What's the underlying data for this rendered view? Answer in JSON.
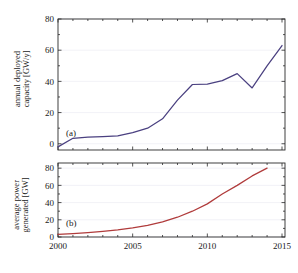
{
  "figure": {
    "background": "#ffffff",
    "axis_color": "#2a2a2a",
    "grid_color": "#e9e9f2"
  },
  "chart_data": [
    {
      "type": "line",
      "panel_tag": "(a)",
      "title": "",
      "xlabel": "",
      "ylabel": "annual deployed capacity [GW/y]",
      "ylabel_line1": "annual deployed",
      "ylabel_line2": "capacity [GW/y]",
      "xlim": [
        2000,
        2015.2
      ],
      "ylim": [
        -4,
        80
      ],
      "xticks": [
        2000,
        2005,
        2010,
        2015
      ],
      "xticklabels": [
        "2000",
        "2005",
        "2010",
        "2015"
      ],
      "xminorticks": [
        2001,
        2002,
        2003,
        2004,
        2006,
        2007,
        2008,
        2009,
        2011,
        2012,
        2013,
        2014
      ],
      "yticks": [
        0,
        20,
        40,
        60,
        80
      ],
      "yticklabels": [
        "0",
        "20",
        "40",
        "60",
        "80"
      ],
      "grid": true,
      "legend": "none",
      "series": [
        {
          "name": "annual deployed capacity",
          "color": "#4a4080",
          "x": [
            2000,
            2001,
            2002,
            2003,
            2004,
            2005,
            2006,
            2007,
            2008,
            2009,
            2010,
            2011,
            2012,
            2013,
            2014,
            2015
          ],
          "values": [
            -2.0,
            3.5,
            4.2,
            4.6,
            5.0,
            7.2,
            10.0,
            16.0,
            28.0,
            38.0,
            38.3,
            40.5,
            45.0,
            35.8,
            50.0,
            63.0
          ]
        }
      ]
    },
    {
      "type": "line",
      "panel_tag": "(b)",
      "title": "",
      "xlabel": "",
      "ylabel": "average power generated [GW]",
      "ylabel_line1": "average power",
      "ylabel_line2": "generated [GW]",
      "xlim": [
        2000,
        2015.2
      ],
      "ylim": [
        0,
        86
      ],
      "xticks": [
        2000,
        2005,
        2010,
        2015
      ],
      "xticklabels": [
        "2000",
        "2005",
        "2010",
        "2015"
      ],
      "xminorticks": [
        2001,
        2002,
        2003,
        2004,
        2006,
        2007,
        2008,
        2009,
        2011,
        2012,
        2013,
        2014
      ],
      "yticks": [
        0,
        20,
        40,
        60,
        80
      ],
      "yticklabels": [
        "0",
        "20",
        "40",
        "60",
        "80"
      ],
      "grid": true,
      "legend": "none",
      "series": [
        {
          "name": "average power generated",
          "color": "#b03b3b",
          "x": [
            2000,
            2001,
            2002,
            2003,
            2004,
            2005,
            2006,
            2007,
            2008,
            2009,
            2010,
            2011,
            2012,
            2013,
            2014
          ],
          "values": [
            3.0,
            4.0,
            5.2,
            6.6,
            8.2,
            10.5,
            13.5,
            17.5,
            23.0,
            30.0,
            38.5,
            50.0,
            60.0,
            71.0,
            80.0
          ]
        }
      ]
    }
  ]
}
